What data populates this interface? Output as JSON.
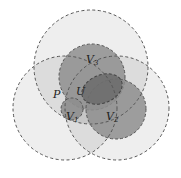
{
  "diagram": {
    "type": "overlapping-sets",
    "labels": {
      "v3": {
        "base": "V",
        "sub": "3"
      },
      "p": {
        "base": "P"
      },
      "u": {
        "base": "U"
      },
      "v1": {
        "base": "V",
        "sub": "1"
      },
      "v2": {
        "base": "V",
        "sub": "2"
      }
    },
    "colors": {
      "outer_fill": "#e9e9e9",
      "outer_overlap_fill": "#d6d6d6",
      "v_fill": "#8f8f8f",
      "u_fill": "#6e6e6e",
      "stroke": "#555555",
      "background": "#ffffff"
    }
  }
}
